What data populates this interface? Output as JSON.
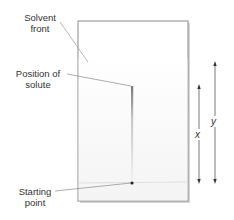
{
  "diagram": {
    "type": "paper-chromatography",
    "labels": {
      "solvent_front": [
        "Solvent",
        "front"
      ],
      "solute_position": [
        "Position of",
        "solute"
      ],
      "starting_point": [
        "Starting",
        "point"
      ]
    },
    "distances": {
      "solute_distance": "x",
      "solvent_distance": "y"
    },
    "colors": {
      "paper_border": "#8a8a8a",
      "leader_line": "#9a9a9a",
      "arrow": "#555555",
      "spot": "#222222",
      "text": "#333333"
    }
  }
}
